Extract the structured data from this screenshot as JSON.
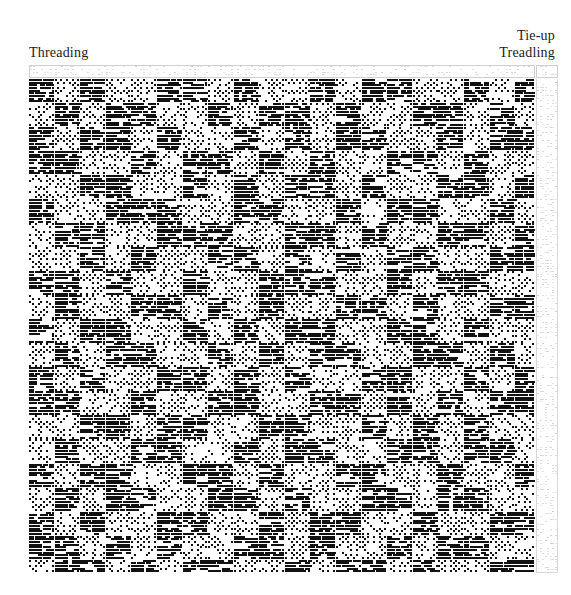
{
  "document": {
    "kind": "weaving-draft",
    "background_color": "#ffffff",
    "ink_color": "#111111",
    "faint_grid_color": "#c8c8c8"
  },
  "labels": {
    "threading": "Threading",
    "tie_up": "Tie-up",
    "treadling": "Treadling"
  },
  "panels": {
    "threading_strip": {
      "x": 29,
      "y": 65,
      "width": 506,
      "height": 13,
      "ends": 178,
      "shafts": 4,
      "visible_ink": "sparse-dotted-grid"
    },
    "tie_up": {
      "x": 536,
      "y": 65,
      "width": 22,
      "height": 13,
      "treadles": 8,
      "shafts": 4,
      "visible_ink": "sparse-dotted-grid"
    },
    "treadling": {
      "x": 536,
      "y": 79,
      "width": 22,
      "height": 494,
      "treadles": 8,
      "picks": 185,
      "visible_ink": "sparse-dotted-grid"
    },
    "drawdown": {
      "x": 29,
      "y": 79,
      "width": 506,
      "height": 494,
      "ends": 178,
      "picks": 185,
      "cell_width": 2.84,
      "cell_height": 2.67,
      "description": "Overshot / block-twill drawdown: horizontal dash runs of warp floats forming square blocks"
    }
  },
  "chart_data": {
    "type": "heatmap",
    "title": "",
    "xlabel": "",
    "ylabel": "",
    "grid": false,
    "legend": "none",
    "columns": 178,
    "rows": 185,
    "block_unit": 9,
    "block_columns": 20,
    "block_rows": 21,
    "fill_levels": {
      "0": "empty (white)",
      "1": "light dotted (isolated picks)",
      "2": "dense dashes (solid floats)"
    },
    "block_profile_x": [
      2,
      1,
      2,
      1,
      1,
      2,
      2,
      1,
      2,
      1,
      1,
      2,
      1,
      2,
      2,
      1,
      1,
      2,
      1,
      2
    ],
    "block_profile_y": [
      2,
      1,
      2,
      2,
      1,
      2,
      1,
      1,
      2,
      1,
      2,
      1,
      2,
      2,
      1,
      1,
      2,
      1,
      2,
      2,
      1
    ],
    "blocks": [
      [
        2,
        1,
        2,
        1,
        1,
        2,
        2,
        1,
        2,
        1,
        1,
        2,
        1,
        2,
        2,
        1,
        1,
        2,
        1,
        2
      ],
      [
        1,
        2,
        1,
        2,
        2,
        1,
        1,
        2,
        1,
        2,
        2,
        1,
        2,
        1,
        1,
        2,
        2,
        1,
        2,
        1
      ],
      [
        2,
        1,
        2,
        2,
        1,
        2,
        1,
        1,
        2,
        1,
        2,
        1,
        2,
        2,
        1,
        1,
        2,
        1,
        2,
        2
      ],
      [
        2,
        2,
        1,
        1,
        2,
        1,
        2,
        2,
        1,
        2,
        1,
        2,
        1,
        1,
        2,
        2,
        1,
        2,
        1,
        1
      ],
      [
        1,
        1,
        2,
        2,
        1,
        1,
        2,
        1,
        2,
        1,
        2,
        2,
        1,
        2,
        1,
        1,
        2,
        2,
        1,
        2
      ],
      [
        2,
        1,
        1,
        2,
        2,
        2,
        1,
        1,
        2,
        2,
        1,
        1,
        2,
        1,
        2,
        2,
        1,
        1,
        2,
        1
      ],
      [
        1,
        2,
        2,
        1,
        1,
        2,
        2,
        2,
        1,
        1,
        2,
        2,
        1,
        2,
        1,
        1,
        2,
        2,
        1,
        2
      ],
      [
        1,
        1,
        2,
        1,
        2,
        1,
        1,
        2,
        2,
        1,
        2,
        1,
        2,
        1,
        2,
        2,
        1,
        1,
        2,
        2
      ],
      [
        2,
        2,
        1,
        2,
        1,
        1,
        2,
        1,
        1,
        2,
        2,
        2,
        1,
        1,
        2,
        1,
        2,
        2,
        1,
        1
      ],
      [
        1,
        2,
        1,
        1,
        2,
        2,
        1,
        2,
        1,
        2,
        1,
        1,
        2,
        2,
        1,
        2,
        1,
        1,
        2,
        2
      ],
      [
        2,
        1,
        2,
        2,
        1,
        1,
        2,
        1,
        2,
        1,
        2,
        2,
        1,
        1,
        2,
        2,
        1,
        2,
        1,
        1
      ],
      [
        1,
        2,
        1,
        2,
        2,
        1,
        1,
        2,
        1,
        2,
        1,
        2,
        2,
        1,
        1,
        2,
        2,
        1,
        2,
        1
      ],
      [
        2,
        1,
        2,
        1,
        1,
        2,
        2,
        1,
        2,
        1,
        2,
        1,
        1,
        2,
        2,
        1,
        1,
        2,
        1,
        2
      ],
      [
        2,
        2,
        1,
        1,
        2,
        1,
        1,
        2,
        2,
        1,
        1,
        2,
        2,
        1,
        2,
        1,
        2,
        1,
        2,
        2
      ],
      [
        1,
        1,
        2,
        2,
        1,
        2,
        2,
        1,
        1,
        2,
        2,
        1,
        1,
        2,
        1,
        2,
        1,
        2,
        1,
        1
      ],
      [
        1,
        2,
        1,
        1,
        2,
        2,
        1,
        1,
        2,
        1,
        2,
        2,
        1,
        1,
        2,
        2,
        1,
        2,
        2,
        1
      ],
      [
        2,
        1,
        2,
        2,
        1,
        1,
        2,
        2,
        1,
        2,
        1,
        1,
        2,
        2,
        1,
        1,
        2,
        1,
        1,
        2
      ],
      [
        1,
        2,
        1,
        2,
        2,
        1,
        1,
        2,
        2,
        1,
        2,
        1,
        1,
        2,
        2,
        1,
        2,
        2,
        1,
        1
      ],
      [
        2,
        1,
        2,
        1,
        1,
        2,
        2,
        1,
        1,
        2,
        1,
        2,
        2,
        1,
        1,
        2,
        1,
        1,
        2,
        2
      ],
      [
        2,
        2,
        1,
        2,
        1,
        2,
        1,
        1,
        2,
        2,
        1,
        2,
        1,
        1,
        2,
        1,
        2,
        2,
        1,
        1
      ],
      [
        1,
        2,
        2,
        1,
        2,
        1,
        2,
        2,
        1,
        1,
        2,
        1,
        2,
        2,
        1,
        2,
        1,
        1,
        2,
        2
      ]
    ]
  }
}
